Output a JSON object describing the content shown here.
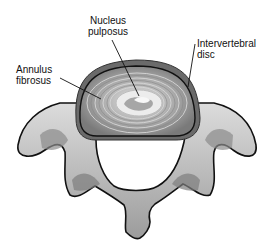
{
  "figure": {
    "labels": [
      {
        "id": "nucleus",
        "line1": "Nucleus",
        "line2": "pulposus"
      },
      {
        "id": "annulus",
        "line1": "Annulus",
        "line2": "fibrosus"
      },
      {
        "id": "disc",
        "line1": "Intervertebral",
        "line2": "disc"
      }
    ],
    "colors": {
      "outline": "#111111",
      "bone_light": "#d9d9d9",
      "bone_mid": "#a8a8a8",
      "bone_dark": "#6e6e6e",
      "disc_rim": "#5f5f5f",
      "annulus_ring": "#9a9a9a",
      "nucleus": "#e8e8e8",
      "background": "#ffffff"
    }
  }
}
